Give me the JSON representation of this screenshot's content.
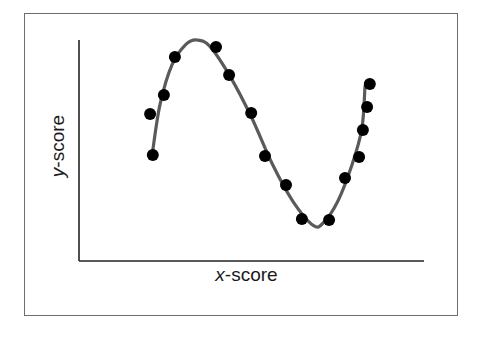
{
  "chart_data": {
    "type": "scatter",
    "title": "",
    "xlabel": "x-score",
    "ylabel": "y-score",
    "xlabel_var": "x",
    "xlabel_rest": "-score",
    "ylabel_var": "y",
    "ylabel_rest": "-score",
    "xlim": [
      0,
      10
    ],
    "ylim": [
      0,
      10
    ],
    "grid": false,
    "ticks": false,
    "legend": null,
    "series": [
      {
        "name": "observations",
        "kind": "scatter",
        "color": "#000000",
        "points": [
          {
            "x": 2.14,
            "y": 4.8
          },
          {
            "x": 2.06,
            "y": 6.65
          },
          {
            "x": 2.46,
            "y": 7.51
          },
          {
            "x": 2.78,
            "y": 9.23
          },
          {
            "x": 3.97,
            "y": 9.68
          },
          {
            "x": 4.35,
            "y": 8.42
          },
          {
            "x": 4.99,
            "y": 6.7
          },
          {
            "x": 5.39,
            "y": 4.75
          },
          {
            "x": 6.0,
            "y": 3.44
          },
          {
            "x": 6.46,
            "y": 1.9
          },
          {
            "x": 7.25,
            "y": 1.86
          },
          {
            "x": 7.71,
            "y": 3.76
          },
          {
            "x": 8.12,
            "y": 4.71
          },
          {
            "x": 8.23,
            "y": 5.93
          },
          {
            "x": 8.35,
            "y": 6.97
          },
          {
            "x": 8.43,
            "y": 8.01
          }
        ]
      },
      {
        "name": "fitted curve",
        "kind": "line",
        "color": "#5a5a5a",
        "points": [
          {
            "x": 2.14,
            "y": 5.02
          },
          {
            "x": 2.35,
            "y": 7.1
          },
          {
            "x": 2.7,
            "y": 8.9
          },
          {
            "x": 3.1,
            "y": 9.8
          },
          {
            "x": 3.42,
            "y": 10.0
          },
          {
            "x": 3.8,
            "y": 9.7
          },
          {
            "x": 4.4,
            "y": 8.3
          },
          {
            "x": 5.0,
            "y": 6.5
          },
          {
            "x": 5.6,
            "y": 4.4
          },
          {
            "x": 6.2,
            "y": 2.7
          },
          {
            "x": 6.8,
            "y": 1.6
          },
          {
            "x": 7.1,
            "y": 1.76
          },
          {
            "x": 7.5,
            "y": 2.7
          },
          {
            "x": 7.9,
            "y": 4.3
          },
          {
            "x": 8.2,
            "y": 6.0
          },
          {
            "x": 8.29,
            "y": 7.9
          }
        ]
      }
    ],
    "note": "No tick marks or numeric labels on axes; values are relative positions estimated on a 0-10 scale."
  }
}
